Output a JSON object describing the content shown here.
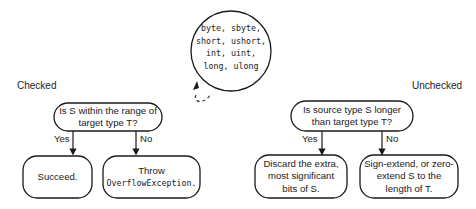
{
  "diagram": {
    "type_set": [
      "byte, sbyte,",
      "short, ushort,",
      "int, uint,",
      "long, ulong"
    ],
    "checked": {
      "label": "Checked",
      "question": [
        "Is S within the range of",
        "target type T?"
      ],
      "yes_label": "Yes",
      "no_label": "No",
      "yes_result": "Succeed.",
      "no_result_line1": "Throw",
      "no_result_code": "OverflowException."
    },
    "unchecked": {
      "label": "Unchecked",
      "question": [
        "Is source type S longer",
        "than target type T?"
      ],
      "yes_label": "Yes",
      "no_label": "No",
      "yes_result": [
        "Discard the extra,",
        "most significant",
        "bits of S."
      ],
      "no_result": [
        "Sign-extend, or zero-",
        "extend S to the",
        "length of T."
      ]
    },
    "colors": {
      "stroke": "#1a1a1a",
      "background": "#ffffff"
    }
  }
}
